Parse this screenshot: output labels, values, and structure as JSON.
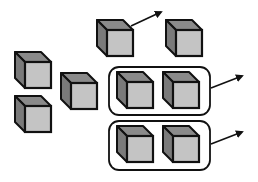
{
  "diagram": {
    "type": "cube-grouping",
    "colors": {
      "outline": "#111111",
      "cube_top": "#8a8a8a",
      "cube_side": "#7a7a7a",
      "cube_front": "#c4c4c4",
      "background": "#ffffff"
    },
    "cubes": [
      {
        "id": "cube-top-center",
        "x": 97,
        "y": 20,
        "has_arrow": true
      },
      {
        "id": "cube-top-right",
        "x": 166,
        "y": 20,
        "has_arrow": false
      },
      {
        "id": "cube-left-upper",
        "x": 15,
        "y": 52,
        "has_arrow": false
      },
      {
        "id": "cube-left-middle",
        "x": 61,
        "y": 73,
        "has_arrow": false
      },
      {
        "id": "cube-left-lower",
        "x": 15,
        "y": 96,
        "has_arrow": false
      }
    ],
    "groups": [
      {
        "id": "group-upper",
        "box": {
          "x": 109,
          "y": 67,
          "w": 101,
          "h": 48
        },
        "cubes": [
          {
            "x": 117,
            "y": 72
          },
          {
            "x": 163,
            "y": 72
          }
        ],
        "arrow": {
          "x1": 211,
          "y1": 88,
          "x2": 242,
          "y2": 76
        }
      },
      {
        "id": "group-lower",
        "box": {
          "x": 109,
          "y": 121,
          "w": 101,
          "h": 49
        },
        "cubes": [
          {
            "x": 117,
            "y": 126
          },
          {
            "x": 163,
            "y": 126
          }
        ],
        "arrow": {
          "x1": 211,
          "y1": 144,
          "x2": 242,
          "y2": 132
        }
      }
    ],
    "single_arrows": [
      {
        "from": "cube-top-center",
        "x1": 131,
        "y1": 26,
        "x2": 161,
        "y2": 12
      }
    ]
  }
}
